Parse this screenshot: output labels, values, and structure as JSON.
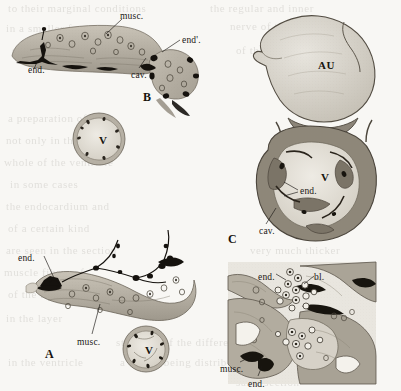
{
  "plate": {
    "title": "Comparative histological sections of the heart wall",
    "background_color": "#f8f7f4",
    "ink_color": "#1a1714",
    "tissue_color": "#b0aa9e",
    "width": 401,
    "height": 391
  },
  "figures": [
    {
      "id": "B",
      "letter": "B",
      "letter_x": 143,
      "letter_y": 90,
      "caption": "Longitudinal section of heart wall",
      "labels": [
        {
          "name": "musc",
          "text": "musc.",
          "x": 120,
          "y": 11
        },
        {
          "name": "end-prime",
          "text": "end'.",
          "x": 182,
          "y": 35
        },
        {
          "name": "end",
          "text": "end.",
          "x": 28,
          "y": 65
        },
        {
          "name": "cav",
          "text": "cav.",
          "x": 131,
          "y": 70
        }
      ]
    },
    {
      "id": "B-inset",
      "letter": "",
      "caption": "Transverse section of ventricle",
      "labels": [
        {
          "name": "ventricle",
          "text": "V",
          "x": 99,
          "y": 134
        }
      ]
    },
    {
      "id": "C",
      "letter": "C",
      "letter_x": 228,
      "letter_y": 232,
      "caption": "Whole heart, auricle and ventricle",
      "labels": [
        {
          "name": "auricle",
          "text": "AU",
          "x": 318,
          "y": 59
        },
        {
          "name": "ventricle",
          "text": "V",
          "x": 321,
          "y": 171
        },
        {
          "name": "end",
          "text": "end.",
          "x": 300,
          "y": 186
        },
        {
          "name": "cav",
          "text": "cav.",
          "x": 259,
          "y": 226
        }
      ]
    },
    {
      "id": "A",
      "letter": "A",
      "letter_x": 45,
      "letter_y": 347,
      "caption": "Longitudinal section of heart wall with nerve endings",
      "labels": [
        {
          "name": "end",
          "text": "end.",
          "x": 18,
          "y": 253
        },
        {
          "name": "musc",
          "text": "musc.",
          "x": 77,
          "y": 337
        }
      ]
    },
    {
      "id": "A-inset",
      "letter": "",
      "caption": "Transverse section of ventricle",
      "labels": [
        {
          "name": "ventricle",
          "text": "V",
          "x": 145,
          "y": 344
        }
      ]
    },
    {
      "id": "D",
      "letter": "",
      "caption": "High magnification detail of heart wall",
      "labels": [
        {
          "name": "end",
          "text": "end.",
          "x": 258,
          "y": 272
        },
        {
          "name": "bl",
          "text": "bl.",
          "x": 314,
          "y": 272
        },
        {
          "name": "musc",
          "text": "musc.",
          "x": 220,
          "y": 364
        },
        {
          "name": "end",
          "text": "end.",
          "x": 248,
          "y": 379
        }
      ]
    }
  ],
  "ghost_text": [
    {
      "text": "to their marginal conditions",
      "x": 8,
      "y": 2
    },
    {
      "text": "the regular and inner",
      "x": 210,
      "y": 2
    },
    {
      "text": "in a smaller form and",
      "x": 6,
      "y": 22
    },
    {
      "text": "nerve of the heart",
      "x": 230,
      "y": 20
    },
    {
      "text": "so that the wall",
      "x": 12,
      "y": 44
    },
    {
      "text": "of the cavity remains",
      "x": 236,
      "y": 44
    },
    {
      "text": "a preparation of",
      "x": 8,
      "y": 112
    },
    {
      "text": "not only in the",
      "x": 6,
      "y": 134
    },
    {
      "text": "whole of the ventricle",
      "x": 4,
      "y": 156
    },
    {
      "text": "in some cases",
      "x": 10,
      "y": 178
    },
    {
      "text": "the endocardium and",
      "x": 6,
      "y": 200
    },
    {
      "text": "of a certain kind",
      "x": 8,
      "y": 222
    },
    {
      "text": "are seen in the section",
      "x": 6,
      "y": 244
    },
    {
      "text": "very much thicker",
      "x": 250,
      "y": 244
    },
    {
      "text": "muscle fibres of",
      "x": 4,
      "y": 266
    },
    {
      "text": "of the blood",
      "x": 8,
      "y": 288
    },
    {
      "text": "in the layer",
      "x": 6,
      "y": 312
    },
    {
      "text": "structure of the differentiated",
      "x": 116,
      "y": 336
    },
    {
      "text": "in the ventricle",
      "x": 8,
      "y": 356
    },
    {
      "text": "a before being distrib",
      "x": 120,
      "y": 356
    },
    {
      "text": "same section",
      "x": 236,
      "y": 376
    }
  ]
}
